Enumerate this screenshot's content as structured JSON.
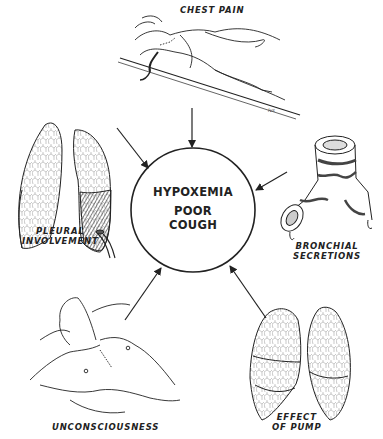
{
  "diagram": {
    "center": {
      "line1": "HYPOXEMIA",
      "line2": "POOR",
      "line3": "COUGH"
    },
    "causes": [
      {
        "id": "chest-pain",
        "label": "CHEST PAIN"
      },
      {
        "id": "pleural-involvement",
        "line1": "PLEURAL",
        "line2": "INVOLVEMENT"
      },
      {
        "id": "bronchial-secretions",
        "line1": "BRONCHIAL",
        "line2": "SECRETIONS"
      },
      {
        "id": "unconsciousness",
        "label": "UNCONSCIOUSNESS"
      },
      {
        "id": "effect-of-pump",
        "line1": "EFFECT",
        "line2": "OF PUMP"
      }
    ],
    "colors": {
      "ink": "#222222",
      "background": "#ffffff",
      "shade": "#555555"
    }
  }
}
